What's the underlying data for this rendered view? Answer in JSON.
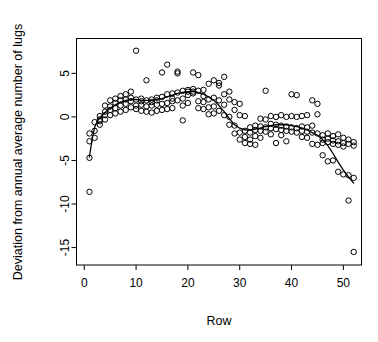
{
  "chart_data": {
    "type": "scatter",
    "title": "",
    "xlabel": "Row",
    "ylabel": "Deviation from annual average number of lugs",
    "xlim": [
      -1.5,
      53.5
    ],
    "ylim": [
      -17.0,
      9.0
    ],
    "xticks": [
      0,
      10,
      20,
      30,
      40,
      50
    ],
    "yticks": [
      5,
      0,
      -5,
      -10,
      -15
    ],
    "xtick_labels": [
      "0",
      "10",
      "20",
      "30",
      "40",
      "50"
    ],
    "ytick_labels": [
      "5",
      "0",
      "-5",
      "-10",
      "-15"
    ],
    "grid": false,
    "legend": null,
    "marker": "open-circle",
    "marker_color": "#000000",
    "line_color": "#000000",
    "series": [
      {
        "name": "Deviation from annual average number of lugs",
        "points": [
          [
            1,
            -4.7
          ],
          [
            1,
            -8.6
          ],
          [
            1,
            -1.9
          ],
          [
            1,
            -2.8
          ],
          [
            2,
            -1.6
          ],
          [
            2,
            -0.6
          ],
          [
            2,
            -2.4
          ],
          [
            3,
            -0.3
          ],
          [
            3,
            -0.5
          ],
          [
            3,
            0.1
          ],
          [
            3,
            -0.9
          ],
          [
            4,
            0.2
          ],
          [
            4,
            -0.3
          ],
          [
            4,
            1.3
          ],
          [
            4,
            0.6
          ],
          [
            5,
            1.9
          ],
          [
            5,
            0.8
          ],
          [
            5,
            0.2
          ],
          [
            5,
            1.2
          ],
          [
            6,
            2.1
          ],
          [
            6,
            1.0
          ],
          [
            6,
            0.4
          ],
          [
            6,
            1.6
          ],
          [
            7,
            2.4
          ],
          [
            7,
            1.3
          ],
          [
            7,
            0.6
          ],
          [
            7,
            1.9
          ],
          [
            8,
            2.6
          ],
          [
            8,
            1.5
          ],
          [
            8,
            0.8
          ],
          [
            8,
            2.0
          ],
          [
            9,
            2.9
          ],
          [
            9,
            1.8
          ],
          [
            9,
            1.1
          ],
          [
            9,
            2.2
          ],
          [
            10,
            7.6
          ],
          [
            10,
            2.0
          ],
          [
            10,
            1.3
          ],
          [
            10,
            0.9
          ],
          [
            11,
            2.1
          ],
          [
            11,
            1.4
          ],
          [
            11,
            0.7
          ],
          [
            11,
            1.8
          ],
          [
            12,
            4.2
          ],
          [
            12,
            1.9
          ],
          [
            12,
            1.2
          ],
          [
            12,
            0.6
          ],
          [
            13,
            2.0
          ],
          [
            13,
            1.3
          ],
          [
            13,
            0.5
          ],
          [
            13,
            1.7
          ],
          [
            14,
            2.2
          ],
          [
            14,
            1.4
          ],
          [
            14,
            0.7
          ],
          [
            14,
            1.9
          ],
          [
            15,
            5.1
          ],
          [
            15,
            2.3
          ],
          [
            15,
            1.5
          ],
          [
            15,
            0.8
          ],
          [
            16,
            6.0
          ],
          [
            16,
            2.6
          ],
          [
            16,
            1.6
          ],
          [
            16,
            0.9
          ],
          [
            17,
            2.7
          ],
          [
            17,
            1.8
          ],
          [
            17,
            1.0
          ],
          [
            17,
            2.1
          ],
          [
            18,
            5.2
          ],
          [
            18,
            5.0
          ],
          [
            18,
            2.8
          ],
          [
            18,
            1.9
          ],
          [
            19,
            3.0
          ],
          [
            19,
            2.1
          ],
          [
            19,
            1.3
          ],
          [
            19,
            -0.4
          ],
          [
            20,
            3.1
          ],
          [
            20,
            2.5
          ],
          [
            20,
            1.6
          ],
          [
            20,
            2.9
          ],
          [
            21,
            5.1
          ],
          [
            21,
            3.2
          ],
          [
            21,
            2.7
          ],
          [
            21,
            2.9
          ],
          [
            22,
            4.8
          ],
          [
            22,
            3.0
          ],
          [
            22,
            1.8
          ],
          [
            22,
            1.0
          ],
          [
            23,
            3.1
          ],
          [
            23,
            1.7
          ],
          [
            23,
            0.9
          ],
          [
            23,
            2.4
          ],
          [
            24,
            3.8
          ],
          [
            24,
            2.0
          ],
          [
            24,
            1.1
          ],
          [
            24,
            0.3
          ],
          [
            25,
            4.2
          ],
          [
            25,
            2.2
          ],
          [
            25,
            1.2
          ],
          [
            25,
            0.4
          ],
          [
            26,
            3.9
          ],
          [
            26,
            3.6
          ],
          [
            26,
            1.9
          ],
          [
            26,
            0.7
          ],
          [
            27,
            4.6
          ],
          [
            27,
            2.6
          ],
          [
            27,
            1.4
          ],
          [
            27,
            0.2
          ],
          [
            28,
            2.9
          ],
          [
            28,
            2.0
          ],
          [
            28,
            0.0
          ],
          [
            28,
            -0.9
          ],
          [
            29,
            1.7
          ],
          [
            29,
            0.8
          ],
          [
            29,
            -1.0
          ],
          [
            29,
            -1.9
          ],
          [
            30,
            1.5
          ],
          [
            30,
            0.2
          ],
          [
            30,
            -1.8
          ],
          [
            30,
            -2.6
          ],
          [
            31,
            0.1
          ],
          [
            31,
            -1.6
          ],
          [
            31,
            -2.3
          ],
          [
            31,
            -3.0
          ],
          [
            32,
            -1.2
          ],
          [
            32,
            -1.8
          ],
          [
            32,
            -2.6
          ],
          [
            32,
            -3.1
          ],
          [
            33,
            -1.0
          ],
          [
            33,
            -1.5
          ],
          [
            33,
            -2.2
          ],
          [
            33,
            -3.2
          ],
          [
            34,
            -0.2
          ],
          [
            34,
            -1.1
          ],
          [
            34,
            -1.6
          ],
          [
            34,
            -2.4
          ],
          [
            35,
            3.0
          ],
          [
            35,
            -0.3
          ],
          [
            35,
            -1.2
          ],
          [
            35,
            -1.7
          ],
          [
            36,
            0.1
          ],
          [
            36,
            -0.8
          ],
          [
            36,
            -1.3
          ],
          [
            36,
            -2.0
          ],
          [
            37,
            0.0
          ],
          [
            37,
            -0.9
          ],
          [
            37,
            -1.4
          ],
          [
            37,
            -3.0
          ],
          [
            38,
            0.2
          ],
          [
            38,
            -1.0
          ],
          [
            38,
            -1.5
          ],
          [
            38,
            -2.1
          ],
          [
            39,
            0.0
          ],
          [
            39,
            -1.1
          ],
          [
            39,
            -1.6
          ],
          [
            39,
            -2.8
          ],
          [
            40,
            2.6
          ],
          [
            40,
            0.1
          ],
          [
            40,
            -1.2
          ],
          [
            40,
            -1.7
          ],
          [
            41,
            2.5
          ],
          [
            41,
            0.0
          ],
          [
            41,
            -1.3
          ],
          [
            41,
            -1.8
          ],
          [
            42,
            0.1
          ],
          [
            42,
            -1.1
          ],
          [
            42,
            -1.6
          ],
          [
            42,
            -2.3
          ],
          [
            43,
            0.2
          ],
          [
            43,
            -1.2
          ],
          [
            43,
            -1.7
          ],
          [
            43,
            -2.4
          ],
          [
            44,
            1.9
          ],
          [
            44,
            -1.0
          ],
          [
            44,
            -1.8
          ],
          [
            44,
            -3.1
          ],
          [
            45,
            1.5
          ],
          [
            45,
            0.3
          ],
          [
            45,
            -1.9
          ],
          [
            45,
            -3.2
          ],
          [
            46,
            -2.1
          ],
          [
            46,
            -2.6
          ],
          [
            46,
            -3.0
          ],
          [
            46,
            -4.4
          ],
          [
            47,
            -1.9
          ],
          [
            47,
            -2.5
          ],
          [
            47,
            -2.9
          ],
          [
            47,
            -5.1
          ],
          [
            48,
            -2.2
          ],
          [
            48,
            -2.7
          ],
          [
            48,
            -3.1
          ],
          [
            48,
            -5.0
          ],
          [
            49,
            -2.0
          ],
          [
            49,
            -2.8
          ],
          [
            49,
            -3.2
          ],
          [
            49,
            -6.3
          ],
          [
            50,
            -2.4
          ],
          [
            50,
            -3.0
          ],
          [
            50,
            -3.4
          ],
          [
            50,
            -6.6
          ],
          [
            51,
            -2.6
          ],
          [
            51,
            -3.1
          ],
          [
            51,
            -6.7
          ],
          [
            51,
            -9.6
          ],
          [
            52,
            -2.9
          ],
          [
            52,
            -3.3
          ],
          [
            52,
            -7.0
          ],
          [
            52,
            -15.5
          ]
        ]
      }
    ],
    "smoother": {
      "name": "lowess",
      "points": [
        [
          1,
          -4.6
        ],
        [
          1.5,
          -2.6
        ],
        [
          2,
          -1.2
        ],
        [
          2.5,
          -0.5
        ],
        [
          3,
          -0.1
        ],
        [
          4,
          0.5
        ],
        [
          5,
          1.0
        ],
        [
          6,
          1.4
        ],
        [
          7,
          1.7
        ],
        [
          8,
          1.9
        ],
        [
          9,
          2.0
        ],
        [
          10,
          2.0
        ],
        [
          11,
          1.9
        ],
        [
          12,
          1.9
        ],
        [
          13,
          1.9
        ],
        [
          14,
          2.0
        ],
        [
          15,
          2.1
        ],
        [
          16,
          2.3
        ],
        [
          17,
          2.5
        ],
        [
          18,
          2.7
        ],
        [
          19,
          2.8
        ],
        [
          20,
          2.9
        ],
        [
          21,
          2.9
        ],
        [
          22,
          2.8
        ],
        [
          23,
          2.6
        ],
        [
          24,
          2.3
        ],
        [
          25,
          1.9
        ],
        [
          26,
          1.3
        ],
        [
          27,
          0.6
        ],
        [
          28,
          -0.2
        ],
        [
          29,
          -0.9
        ],
        [
          30,
          -1.3
        ],
        [
          31,
          -1.5
        ],
        [
          32,
          -1.5
        ],
        [
          33,
          -1.4
        ],
        [
          34,
          -1.3
        ],
        [
          35,
          -1.1
        ],
        [
          36,
          -1.0
        ],
        [
          37,
          -0.9
        ],
        [
          38,
          -0.9
        ],
        [
          39,
          -0.9
        ],
        [
          40,
          -1.0
        ],
        [
          41,
          -1.1
        ],
        [
          42,
          -1.3
        ],
        [
          43,
          -1.5
        ],
        [
          44,
          -1.8
        ],
        [
          45,
          -2.1
        ],
        [
          46,
          -2.6
        ],
        [
          47,
          -3.3
        ],
        [
          48,
          -4.2
        ],
        [
          49,
          -5.2
        ],
        [
          50,
          -6.1
        ],
        [
          51,
          -6.9
        ],
        [
          52,
          -7.6
        ]
      ]
    }
  }
}
